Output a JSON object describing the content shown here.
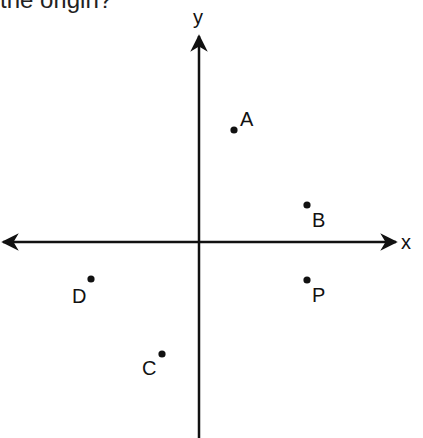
{
  "question_fragment": "the origin?",
  "axes": {
    "x_label": "x",
    "y_label": "y",
    "origin_px": [
      199,
      242
    ]
  },
  "points": [
    {
      "label": "A",
      "cx": 234,
      "cy": 130,
      "lx": 240,
      "ly": 126
    },
    {
      "label": "B",
      "cx": 307,
      "cy": 205,
      "lx": 312,
      "ly": 227
    },
    {
      "label": "P",
      "cx": 307,
      "cy": 280,
      "lx": 312,
      "ly": 302
    },
    {
      "label": "D",
      "cx": 91,
      "cy": 279,
      "lx": 72,
      "ly": 303
    },
    {
      "label": "C",
      "cx": 162,
      "cy": 354,
      "lx": 142,
      "ly": 375
    }
  ],
  "colors": {
    "ink": "#111111",
    "background": "#ffffff"
  }
}
